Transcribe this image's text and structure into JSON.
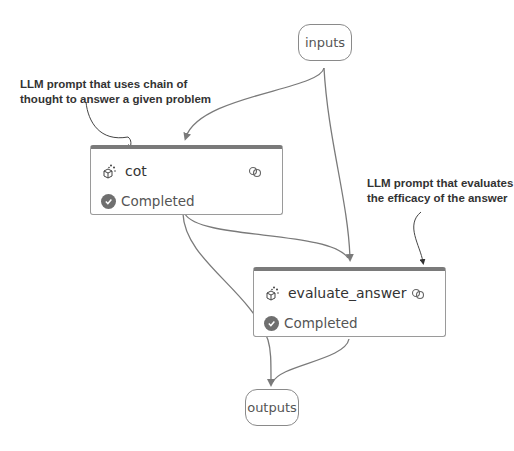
{
  "nodes": {
    "inputs": {
      "label": "inputs"
    },
    "cot": {
      "title": "cot",
      "status": "Completed",
      "icon": "llm-sparkle-cube-icon",
      "link_icon": "link-icon"
    },
    "evaluate_answer": {
      "title": "evaluate_answer",
      "status": "Completed",
      "icon": "llm-sparkle-cube-icon",
      "link_icon": "link-icon"
    },
    "outputs": {
      "label": "outputs"
    }
  },
  "annotations": {
    "cot_note": {
      "line1": "LLM prompt that uses chain of",
      "line2": "thought to answer a given problem"
    },
    "evaluate_note": {
      "line1": "LLM prompt that evaluates",
      "line2": "the efficacy of the answer"
    }
  },
  "edges": [
    {
      "from": "inputs",
      "to": "cot"
    },
    {
      "from": "inputs",
      "to": "evaluate_answer"
    },
    {
      "from": "cot",
      "to": "evaluate_answer"
    },
    {
      "from": "cot",
      "to": "outputs"
    },
    {
      "from": "evaluate_answer",
      "to": "outputs"
    }
  ],
  "colors": {
    "edge": "#7a7a7a",
    "node_border": "#9a9a9a",
    "node_header": "#7a7a7a",
    "status_check": "#6f6f6f"
  }
}
